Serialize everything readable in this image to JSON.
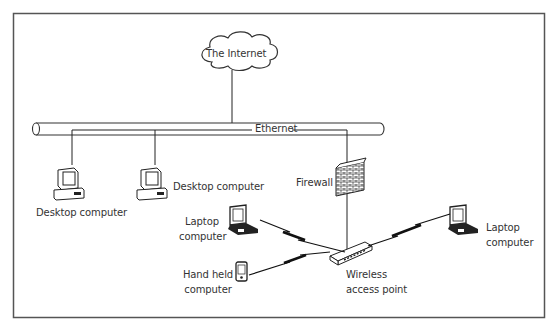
{
  "diagram": {
    "type": "network-topology",
    "colors": {
      "stroke": "#222222",
      "frame": "#555555",
      "text": "#333333",
      "background": "#ffffff"
    },
    "nodes": {
      "internet": {
        "label": "The Internet",
        "shape": "cloud"
      },
      "ethernet": {
        "label": "Ethernet",
        "shape": "cable-backbone"
      },
      "desktop1": {
        "label": "Desktop computer",
        "shape": "desktop"
      },
      "desktop2": {
        "label": "Desktop computer",
        "shape": "desktop"
      },
      "firewall": {
        "label": "Firewall",
        "shape": "brick-wall"
      },
      "laptop1": {
        "label_line1": "Laptop",
        "label_line2": "computer",
        "shape": "laptop"
      },
      "laptop2": {
        "label_line1": "Laptop",
        "label_line2": "computer",
        "shape": "laptop"
      },
      "handheld": {
        "label_line1": "Hand held",
        "label_line2": "computer",
        "shape": "pda"
      },
      "wap": {
        "label_line1": "Wireless",
        "label_line2": "access point",
        "shape": "router"
      }
    },
    "edges": [
      {
        "from": "internet",
        "to": "ethernet",
        "kind": "wired"
      },
      {
        "from": "ethernet",
        "to": "desktop1",
        "kind": "wired"
      },
      {
        "from": "ethernet",
        "to": "desktop2",
        "kind": "wired"
      },
      {
        "from": "ethernet",
        "to": "firewall",
        "kind": "wired"
      },
      {
        "from": "firewall",
        "to": "wap",
        "kind": "wired"
      },
      {
        "from": "laptop1",
        "to": "wap",
        "kind": "wireless"
      },
      {
        "from": "laptop2",
        "to": "wap",
        "kind": "wireless"
      },
      {
        "from": "handheld",
        "to": "wap",
        "kind": "wireless"
      }
    ]
  }
}
